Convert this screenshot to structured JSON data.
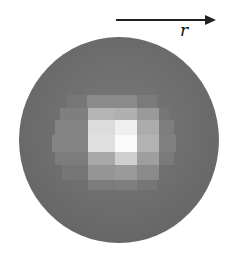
{
  "arrow": {
    "label": "r",
    "direction": "right"
  },
  "sphere": {
    "base_color": "#6a6a6a",
    "cells": [
      {
        "x": 67,
        "y": 95,
        "w": 20,
        "h": 13,
        "c": "#777777"
      },
      {
        "x": 87,
        "y": 95,
        "w": 28,
        "h": 13,
        "c": "#8a8a8a"
      },
      {
        "x": 115,
        "y": 95,
        "w": 22,
        "h": 13,
        "c": "#8a8a8a"
      },
      {
        "x": 137,
        "y": 95,
        "w": 20,
        "h": 13,
        "c": "#7b7b7b"
      },
      {
        "x": 60,
        "y": 108,
        "w": 28,
        "h": 12,
        "c": "#7f7f7f"
      },
      {
        "x": 88,
        "y": 108,
        "w": 27,
        "h": 12,
        "c": "#b4b4b4"
      },
      {
        "x": 115,
        "y": 108,
        "w": 22,
        "h": 12,
        "c": "#b0b0b0"
      },
      {
        "x": 137,
        "y": 108,
        "w": 22,
        "h": 12,
        "c": "#9a9a9a"
      },
      {
        "x": 159,
        "y": 108,
        "w": 10,
        "h": 12,
        "c": "#767676"
      },
      {
        "x": 55,
        "y": 120,
        "w": 33,
        "h": 15,
        "c": "#838383"
      },
      {
        "x": 88,
        "y": 120,
        "w": 27,
        "h": 15,
        "c": "#dcdcdc"
      },
      {
        "x": 115,
        "y": 120,
        "w": 22,
        "h": 15,
        "c": "#efefef"
      },
      {
        "x": 137,
        "y": 120,
        "w": 22,
        "h": 15,
        "c": "#acacac"
      },
      {
        "x": 159,
        "y": 120,
        "w": 15,
        "h": 15,
        "c": "#7e7e7e"
      },
      {
        "x": 52,
        "y": 135,
        "w": 36,
        "h": 17,
        "c": "#838383"
      },
      {
        "x": 88,
        "y": 135,
        "w": 27,
        "h": 17,
        "c": "#e0e0e0"
      },
      {
        "x": 115,
        "y": 135,
        "w": 22,
        "h": 17,
        "c": "#fafafa"
      },
      {
        "x": 137,
        "y": 135,
        "w": 22,
        "h": 17,
        "c": "#b2b2b2"
      },
      {
        "x": 159,
        "y": 135,
        "w": 17,
        "h": 17,
        "c": "#808080"
      },
      {
        "x": 55,
        "y": 152,
        "w": 33,
        "h": 13,
        "c": "#7c7c7c"
      },
      {
        "x": 88,
        "y": 152,
        "w": 27,
        "h": 13,
        "c": "#a8a8a8"
      },
      {
        "x": 115,
        "y": 152,
        "w": 22,
        "h": 13,
        "c": "#cfcfcf"
      },
      {
        "x": 137,
        "y": 152,
        "w": 22,
        "h": 13,
        "c": "#9e9e9e"
      },
      {
        "x": 159,
        "y": 152,
        "w": 15,
        "h": 13,
        "c": "#7a7a7a"
      },
      {
        "x": 62,
        "y": 165,
        "w": 26,
        "h": 15,
        "c": "#767676"
      },
      {
        "x": 88,
        "y": 165,
        "w": 27,
        "h": 15,
        "c": "#959595"
      },
      {
        "x": 115,
        "y": 165,
        "w": 22,
        "h": 15,
        "c": "#9a9a9a"
      },
      {
        "x": 137,
        "y": 165,
        "w": 22,
        "h": 15,
        "c": "#8a8a8a"
      },
      {
        "x": 88,
        "y": 180,
        "w": 27,
        "h": 10,
        "c": "#7c7c7c"
      },
      {
        "x": 115,
        "y": 180,
        "w": 22,
        "h": 10,
        "c": "#7e7e7e"
      },
      {
        "x": 137,
        "y": 180,
        "w": 20,
        "h": 10,
        "c": "#767676"
      }
    ]
  }
}
